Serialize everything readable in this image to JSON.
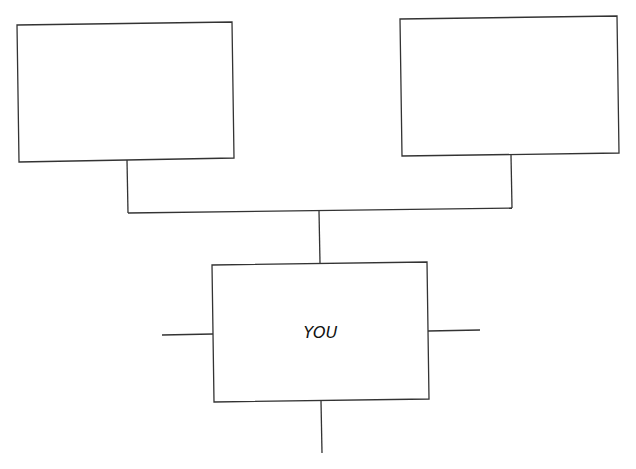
{
  "diagram": {
    "type": "family-tree",
    "line_color": "#333333",
    "boxes": [
      {
        "id": "parent-left",
        "label": ""
      },
      {
        "id": "parent-right",
        "label": ""
      },
      {
        "id": "self",
        "label": "YOU"
      }
    ]
  }
}
